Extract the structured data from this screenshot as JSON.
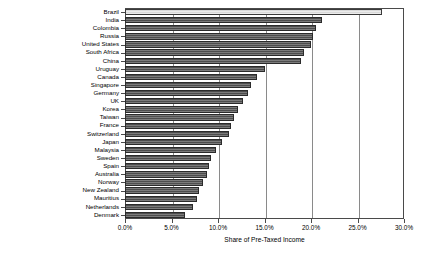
{
  "chart_data": {
    "type": "bar",
    "orientation": "horizontal",
    "title": "",
    "subtitle": "",
    "xlabel": "Share of Pre-Taxed Income",
    "ylabel": "",
    "xlim": [
      0,
      30
    ],
    "ylim": null,
    "grid": true,
    "grid_axis": "x",
    "legend": null,
    "legend_position": "none",
    "xtick_labels": [
      "0.0%",
      "5.0%",
      "10.0%",
      "15.0%",
      "20.0%",
      "25.0%",
      "30.0%"
    ],
    "xtick_values": [
      0,
      5,
      10,
      15,
      20,
      25,
      30
    ],
    "value_suffix": "%",
    "highlight_category": "Brazil",
    "categories": [
      "Brazil",
      "India",
      "Colombia",
      "Russia",
      "United States",
      "South Africa",
      "China",
      "Uruguay",
      "Canada",
      "Singapore",
      "Germany",
      "UK",
      "Korea",
      "Taiwan",
      "France",
      "Switzerland",
      "Japan",
      "Malaysia",
      "Sweden",
      "Spain",
      "Australia",
      "Norway",
      "New Zealand",
      "Mauritius",
      "Netherlands",
      "Denmark"
    ],
    "values": [
      27.6,
      21.2,
      20.5,
      20.2,
      20.0,
      19.3,
      18.9,
      15.0,
      14.2,
      13.6,
      13.2,
      12.7,
      12.2,
      11.7,
      11.4,
      11.2,
      10.4,
      9.8,
      9.2,
      9.0,
      8.8,
      8.4,
      8.0,
      7.7,
      7.3,
      6.4
    ]
  },
  "colors": {
    "bar_fill": "#4d4d4d",
    "bar_highlight_fill": "#d9d9d9",
    "bar_edge": "#2b2b2b",
    "grid": "#8a8a8a",
    "axis": "#4a4a4a",
    "background": "#ffffff",
    "text": "#000000"
  }
}
